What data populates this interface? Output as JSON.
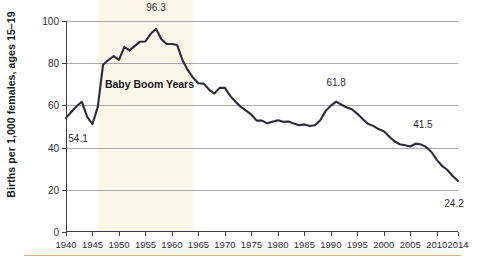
{
  "chart_data": {
    "type": "line",
    "title": "",
    "xlabel": "",
    "ylabel": "Births per 1,000 females, ages 15–19",
    "xlim": [
      1940,
      2014
    ],
    "ylim": [
      0,
      100
    ],
    "grid": true,
    "legend": "none",
    "y_ticks": [
      0,
      20,
      40,
      60,
      80,
      100
    ],
    "y_tick_labels": [
      "0",
      "20",
      "40",
      "60",
      "80",
      "100"
    ],
    "x_ticks": [
      1940,
      1945,
      1950,
      1955,
      1960,
      1965,
      1970,
      1975,
      1980,
      1985,
      1990,
      1995,
      2000,
      2005,
      2010,
      2014
    ],
    "x_tick_labels": [
      "1940",
      "1945",
      "1950",
      "1955",
      "1960",
      "1965",
      "1970",
      "1975",
      "1980",
      "1985",
      "1990",
      "1995",
      "2000",
      "2005",
      "2010",
      "2014"
    ],
    "line_color": "#2b2b3c",
    "x": [
      1940,
      1941,
      1942,
      1943,
      1944,
      1945,
      1946,
      1947,
      1948,
      1949,
      1950,
      1951,
      1952,
      1953,
      1954,
      1955,
      1956,
      1957,
      1958,
      1959,
      1960,
      1961,
      1962,
      1963,
      1964,
      1965,
      1966,
      1967,
      1968,
      1969,
      1970,
      1971,
      1972,
      1973,
      1974,
      1975,
      1976,
      1977,
      1978,
      1979,
      1980,
      1981,
      1982,
      1983,
      1984,
      1985,
      1986,
      1987,
      1988,
      1989,
      1990,
      1991,
      1992,
      1993,
      1994,
      1995,
      1996,
      1997,
      1998,
      1999,
      2000,
      2001,
      2002,
      2003,
      2004,
      2005,
      2006,
      2007,
      2008,
      2009,
      2010,
      2011,
      2012,
      2013,
      2014
    ],
    "values": [
      54.1,
      56.9,
      59.6,
      61.7,
      54.6,
      51.1,
      59.3,
      79.3,
      81.5,
      83.4,
      81.6,
      87.6,
      86.1,
      88.2,
      90.2,
      90.3,
      94.0,
      96.3,
      91.4,
      89.1,
      89.1,
      88.6,
      81.4,
      76.7,
      73.1,
      70.5,
      70.3,
      67.5,
      65.6,
      68.3,
      68.3,
      64.5,
      61.7,
      59.3,
      57.5,
      55.6,
      52.8,
      52.8,
      51.5,
      52.3,
      53.0,
      52.2,
      52.4,
      51.4,
      50.6,
      51.0,
      50.2,
      50.6,
      53.0,
      57.3,
      59.9,
      61.8,
      60.3,
      59.0,
      58.2,
      56.0,
      53.5,
      51.3,
      50.3,
      48.8,
      47.7,
      45.3,
      43.0,
      41.6,
      41.1,
      40.5,
      41.9,
      41.5,
      40.2,
      37.9,
      34.2,
      31.3,
      29.4,
      26.5,
      24.2
    ],
    "point_labels": [
      {
        "year": 1940,
        "value": 54.1,
        "text": "54.1"
      },
      {
        "year": 1957,
        "value": 96.3,
        "text": "96.3"
      },
      {
        "year": 1991,
        "value": 61.8,
        "text": "61.8"
      },
      {
        "year": 2007,
        "value": 41.5,
        "text": "41.5"
      },
      {
        "year": 2014,
        "value": 24.2,
        "text": "24.2"
      }
    ],
    "annotations": [
      {
        "label": "Baby Boom Years",
        "band_start": 1946,
        "band_end": 1964,
        "band_color": "#faf6e8"
      }
    ]
  }
}
